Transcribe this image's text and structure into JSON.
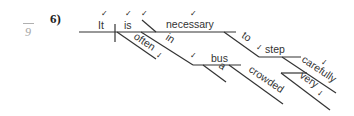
{
  "margin": {
    "number": "9"
  },
  "problem": {
    "label": "6)"
  },
  "diagram": {
    "words": {
      "subject": "It",
      "verb": "is",
      "predicate_adjective": "necessary",
      "adverb_often": "often",
      "preposition_in": "in",
      "object_bus": "bus",
      "article_a": "a",
      "adjective_crowded": "crowded",
      "infinitive_to": "to",
      "infinitive_step": "step",
      "adverb_carefully": "carefully",
      "adverb_very": "very"
    },
    "check_mark": "✓",
    "colors": {
      "line": "#333333",
      "text": "#333333",
      "margin": "#a8a8a8"
    }
  }
}
